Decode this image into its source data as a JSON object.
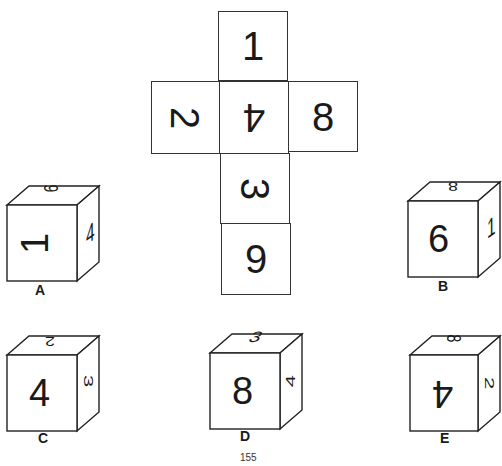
{
  "net": {
    "faces": [
      {
        "pos": "top",
        "value": "1",
        "rotate": 0
      },
      {
        "pos": "left",
        "value": "2",
        "rotate": 90
      },
      {
        "pos": "center",
        "value": "4",
        "rotate": 180
      },
      {
        "pos": "right",
        "value": "8",
        "rotate": 0
      },
      {
        "pos": "below-center",
        "value": "3",
        "rotate": 90
      },
      {
        "pos": "bottom",
        "value": "9",
        "rotate": 0
      }
    ]
  },
  "options": [
    {
      "label": "A",
      "front": "1",
      "top": "9",
      "side": "4"
    },
    {
      "label": "B",
      "front": "6",
      "top": "8",
      "side": "1"
    },
    {
      "label": "C",
      "front": "4",
      "top": "2",
      "side": "3"
    },
    {
      "label": "D",
      "front": "8",
      "top": "3",
      "side": "4"
    },
    {
      "label": "E",
      "front": "4",
      "top": "8",
      "side": "2"
    }
  ],
  "page_number": "155"
}
